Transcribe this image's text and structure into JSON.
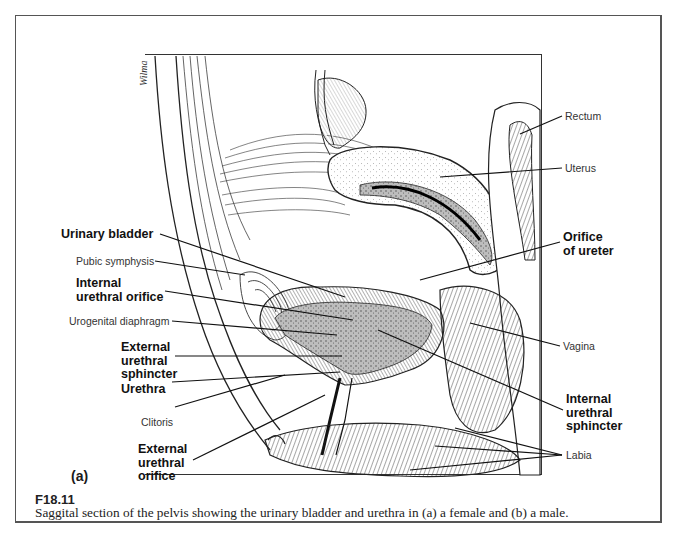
{
  "figure": {
    "panel_letter": "(a)",
    "number": "F18.11",
    "caption": "Saggital section of the pelvis showing the urinary bladder and urethra in (a) a female and (b) a male.",
    "signature": "Wilma"
  },
  "labels": {
    "left": [
      {
        "id": "urinary-bladder",
        "text": "Urinary bladder",
        "bold": true
      },
      {
        "id": "pubic-symphysis",
        "text": "Pubic symphysis",
        "bold": false
      },
      {
        "id": "internal-urethral-orifice",
        "text": "Internal\nurethral orifice",
        "line1": "Internal",
        "line2": "urethral orifice",
        "bold": true
      },
      {
        "id": "urogenital-diaphragm",
        "text": "Urogenital diaphragm",
        "bold": false
      },
      {
        "id": "external-urethral-sphincter",
        "line1": "External",
        "line2": "urethral",
        "line3": "sphincter",
        "bold": true
      },
      {
        "id": "urethra",
        "text": "Urethra",
        "bold": true
      },
      {
        "id": "clitoris",
        "text": "Clitoris",
        "bold": false
      },
      {
        "id": "external-urethral-orifice",
        "line1": "External",
        "line2": "urethral",
        "line3": "orifice",
        "bold": true
      }
    ],
    "right": [
      {
        "id": "rectum",
        "text": "Rectum",
        "bold": false
      },
      {
        "id": "uterus",
        "text": "Uterus",
        "bold": false
      },
      {
        "id": "orifice-of-ureter",
        "line1": "Orifice",
        "line2": "of ureter",
        "bold": true
      },
      {
        "id": "vagina",
        "text": "Vagina",
        "bold": false
      },
      {
        "id": "internal-urethral-sphincter",
        "line1": "Internal",
        "line2": "urethral",
        "line3": "sphincter",
        "bold": true
      },
      {
        "id": "labia",
        "text": "Labia",
        "bold": false
      }
    ]
  },
  "colors": {
    "ink": "#1a1a1a",
    "bladder_fill": "#b8b8b8",
    "frame": "#555555"
  }
}
